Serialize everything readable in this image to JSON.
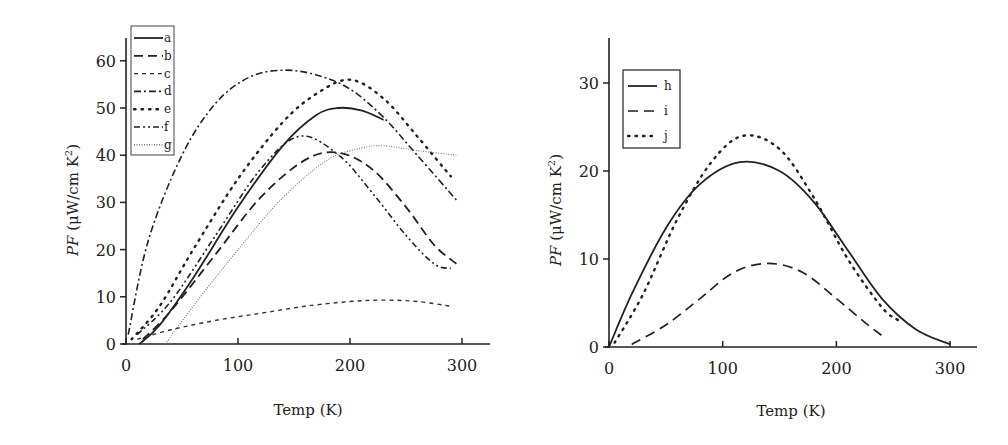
{
  "chart_data": [
    {
      "type": "line",
      "title": "",
      "xlabel": "Temp (K)",
      "ylabel": "PF (μW/cm K²)",
      "xlim": [
        0,
        325
      ],
      "ylim": [
        0,
        65
      ],
      "xticks": [
        0,
        100,
        200,
        300
      ],
      "yticks": [
        0,
        10,
        20,
        30,
        40,
        50,
        60
      ],
      "grid": false,
      "legend_position": "upper-left",
      "series": [
        {
          "name": "a",
          "style": "solid",
          "x": [
            12,
            30,
            60,
            100,
            140,
            170,
            190,
            210,
            230
          ],
          "values": [
            0,
            4,
            14,
            29,
            42,
            48.5,
            50,
            49.5,
            47.5
          ]
        },
        {
          "name": "b",
          "style": "long-dash",
          "x": [
            15,
            40,
            80,
            120,
            160,
            190,
            220,
            250,
            275,
            295
          ],
          "values": [
            1,
            7,
            19,
            31,
            39,
            40.5,
            37,
            29,
            21,
            17
          ]
        },
        {
          "name": "c",
          "style": "short-dash",
          "x": [
            10,
            40,
            80,
            120,
            160,
            200,
            230,
            260,
            290
          ],
          "values": [
            1,
            3,
            5,
            6.5,
            8,
            9,
            9.3,
            9,
            8
          ]
        },
        {
          "name": "d",
          "style": "dash-dot",
          "x": [
            2,
            20,
            50,
            80,
            110,
            140,
            170,
            200,
            230,
            260,
            295
          ],
          "values": [
            2,
            22,
            40,
            51,
            56.5,
            58,
            57,
            54,
            48,
            40,
            30.5
          ]
        },
        {
          "name": "e",
          "style": "dotted",
          "x": [
            5,
            30,
            60,
            100,
            140,
            170,
            200,
            230,
            260,
            290
          ],
          "values": [
            1,
            8,
            20,
            35,
            47,
            53,
            56,
            52,
            44,
            35.5
          ]
        },
        {
          "name": "f",
          "style": "dash-dot-dot",
          "x": [
            10,
            40,
            80,
            120,
            155,
            190,
            220,
            250,
            275,
            290
          ],
          "values": [
            2,
            9,
            23,
            37,
            44,
            40,
            32,
            23,
            17,
            16
          ]
        },
        {
          "name": "g",
          "style": "fine-dotted",
          "x": [
            35,
            60,
            100,
            140,
            180,
            210,
            230,
            260,
            295
          ],
          "values": [
            0,
            8,
            20,
            31,
            39,
            41.5,
            42,
            41,
            40
          ]
        }
      ]
    },
    {
      "type": "line",
      "title": "",
      "xlabel": "Temp (K)",
      "ylabel": "PF (μW/cm K²)",
      "xlim": [
        0,
        322
      ],
      "ylim": [
        0,
        35
      ],
      "xticks": [
        0,
        100,
        200,
        300
      ],
      "yticks": [
        0,
        10,
        20,
        30
      ],
      "grid": false,
      "legend_position": "upper-left",
      "series": [
        {
          "name": "h",
          "style": "solid",
          "x": [
            0,
            20,
            50,
            80,
            115,
            150,
            180,
            210,
            240,
            270,
            300
          ],
          "values": [
            0,
            6,
            13.5,
            18.5,
            21,
            20,
            16.5,
            11,
            5.5,
            2,
            0.3
          ]
        },
        {
          "name": "i",
          "style": "dashed",
          "x": [
            20,
            50,
            80,
            110,
            140,
            170,
            200,
            225,
            243
          ],
          "values": [
            0.3,
            2.5,
            5.5,
            8.5,
            9.5,
            8.5,
            5.5,
            2.8,
            1
          ]
        },
        {
          "name": "j",
          "style": "dotted",
          "x": [
            5,
            30,
            60,
            90,
            118,
            150,
            180,
            210,
            240,
            255
          ],
          "values": [
            0.5,
            6,
            14.5,
            21,
            24,
            22.5,
            17,
            10,
            4.5,
            3
          ]
        }
      ]
    }
  ],
  "left_chart": {
    "xlabel": "Temp (K)",
    "ylabel_italic": "PF",
    "ylabel_rest": " (μW/cm K",
    "ylabel_sup": "2",
    "ylabel_close": ")",
    "xtick_labels": [
      "0",
      "100",
      "200",
      "300"
    ],
    "ytick_labels": [
      "0",
      "10",
      "20",
      "30",
      "40",
      "50",
      "60"
    ],
    "legend": [
      "a",
      "b",
      "c",
      "d",
      "e",
      "f",
      "g"
    ]
  },
  "right_chart": {
    "xlabel": "Temp (K)",
    "ylabel_italic": "PF",
    "ylabel_rest": " (μW/cm K",
    "ylabel_sup": "2",
    "ylabel_close": ")",
    "xtick_labels": [
      "0",
      "100",
      "200",
      "300"
    ],
    "ytick_labels": [
      "0",
      "10",
      "20",
      "30"
    ],
    "legend": [
      "h",
      "i",
      "j"
    ]
  },
  "colors": {
    "ink": "#222222",
    "light_ink": "#777777",
    "background": "#ffffff"
  }
}
